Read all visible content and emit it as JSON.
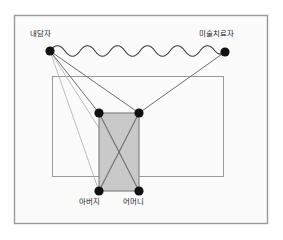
{
  "figure": {
    "title": "",
    "frame": {
      "x": 14,
      "y": 15,
      "width": 254,
      "height": 209,
      "fill": "#fbfbfb",
      "stroke": "#9a9a9a"
    },
    "colors": {
      "node_fill": "#111111",
      "line": "#6e6e6e",
      "thin_line": "#b0b0b0",
      "shaded_fill": "#c9c9c9",
      "shaded_stroke": "#7d7d7d",
      "outer_box_stroke": "#9a9a9a",
      "page_background": "#ffffff",
      "text": "#1c1c1c"
    },
    "nodes": [
      {
        "id": "client",
        "label": "내담자",
        "x": 50,
        "y": 51,
        "r": 4.6,
        "label_position": "above-left"
      },
      {
        "id": "therapist",
        "label": "미술치료자",
        "x": 225,
        "y": 52,
        "r": 4.6,
        "label_position": "above-right"
      },
      {
        "id": "father",
        "label": "아버지",
        "x": 99,
        "y": 191,
        "r": 4.6,
        "label_position": "below"
      },
      {
        "id": "mother",
        "label": "어머니",
        "x": 139,
        "y": 191,
        "r": 4.6,
        "label_position": "below"
      },
      {
        "id": "inner-left",
        "label": "",
        "x": 99,
        "y": 113,
        "r": 4.6,
        "label_position": "none"
      },
      {
        "id": "inner-right",
        "label": "",
        "x": 139,
        "y": 113,
        "r": 4.6,
        "label_position": "none"
      }
    ],
    "outer_box": {
      "x": 52,
      "y": 76,
      "width": 172,
      "height": 101
    },
    "shaded_box": {
      "x": 99,
      "y": 113,
      "width": 40,
      "height": 78
    },
    "wavy_connector": {
      "from": "client",
      "to": "therapist",
      "style": "wavy",
      "amplitude": 4,
      "wavelength": 21
    },
    "straight_connectors": [
      {
        "from": "client",
        "to": "inner-left"
      },
      {
        "from": "client",
        "to": "inner-right"
      },
      {
        "from": "client",
        "to": "father"
      },
      {
        "from": "client",
        "to": "mother"
      },
      {
        "from": "therapist",
        "to": "inner-right"
      },
      {
        "from": "inner-left",
        "to": "mother"
      },
      {
        "from": "inner-right",
        "to": "father"
      },
      {
        "from": "father",
        "to": "mother"
      },
      {
        "from": "inner-left",
        "to": "inner-right"
      }
    ]
  }
}
